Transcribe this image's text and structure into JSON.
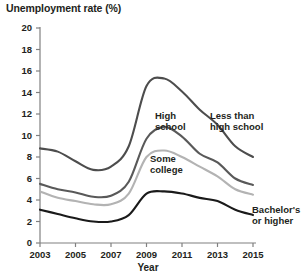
{
  "chart_data": {
    "type": "line",
    "title": "Unemployment rate (%)",
    "xlabel": "Year",
    "ylabel": "",
    "xlim": [
      2003,
      2015
    ],
    "ylim": [
      0,
      20
    ],
    "grid": false,
    "legend_position": "inline-labels",
    "x": [
      2003,
      2004,
      2005,
      2006,
      2007,
      2008,
      2009,
      2010,
      2011,
      2012,
      2013,
      2014,
      2015
    ],
    "xticks": [
      "2003",
      "2005",
      "2007",
      "2009",
      "2011",
      "2013",
      "2015"
    ],
    "yticks": [
      "0",
      "2",
      "4",
      "6",
      "8",
      "10",
      "12",
      "14",
      "16",
      "18",
      "20"
    ],
    "series": [
      {
        "name": "Less than high school",
        "color": "#4d4d4d",
        "values": [
          8.8,
          8.5,
          7.6,
          6.8,
          7.1,
          9.0,
          14.6,
          15.3,
          14.1,
          12.4,
          11.0,
          9.0,
          8.0
        ]
      },
      {
        "name": "High school",
        "color": "#595959",
        "values": [
          5.5,
          5.0,
          4.7,
          4.3,
          4.4,
          5.7,
          9.7,
          10.8,
          9.9,
          8.3,
          7.5,
          6.0,
          5.4
        ]
      },
      {
        "name": "Some college",
        "color": "#b3b3b3",
        "values": [
          4.8,
          4.2,
          3.9,
          3.6,
          3.6,
          4.6,
          8.0,
          8.6,
          8.0,
          7.1,
          6.2,
          5.0,
          4.5
        ]
      },
      {
        "name": "Bachelor's or higher",
        "color": "#1a1a1a",
        "values": [
          3.1,
          2.7,
          2.3,
          2.0,
          2.0,
          2.6,
          4.6,
          4.8,
          4.6,
          4.2,
          3.9,
          3.1,
          2.6
        ]
      }
    ],
    "annotations": [
      {
        "text": "High school",
        "line1": "High",
        "line2": "school",
        "x": 155,
        "y": 110
      },
      {
        "text": "Less than high school",
        "line1": "Less than",
        "line2": "high school",
        "x": 210,
        "y": 110
      },
      {
        "text": "Some college",
        "line1": "Some",
        "line2": "college",
        "x": 150,
        "y": 153
      },
      {
        "text": "Bachelor's or higher",
        "line1": "Bachelor's",
        "line2": "or higher",
        "x": 252,
        "y": 204
      }
    ]
  }
}
